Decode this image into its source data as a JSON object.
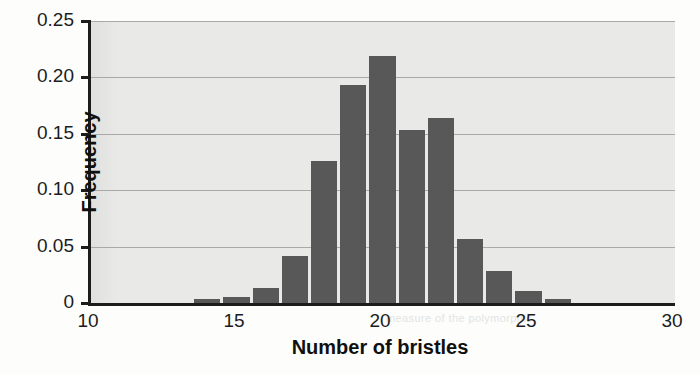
{
  "chart_data": {
    "type": "bar",
    "title": "",
    "subtitle": "",
    "xlabel": "Number of bristles",
    "ylabel": "Frequency",
    "categories": [
      14,
      15,
      16,
      17,
      18,
      19,
      20,
      21,
      22,
      23,
      24,
      25,
      26
    ],
    "values": [
      0.004,
      0.005,
      0.013,
      0.042,
      0.126,
      0.193,
      0.219,
      0.153,
      0.164,
      0.057,
      0.028,
      0.011,
      0.004
    ],
    "series": [
      {
        "name": "Frequency",
        "values": [
          0.004,
          0.005,
          0.013,
          0.042,
          0.126,
          0.193,
          0.219,
          0.153,
          0.164,
          0.057,
          0.028,
          0.011,
          0.004
        ]
      }
    ],
    "xlim": [
      10,
      30
    ],
    "ylim": [
      0,
      0.25
    ],
    "xticks": [
      10,
      15,
      20,
      25,
      30
    ],
    "xtick_labels": [
      "10",
      "15",
      "20",
      "25",
      "30"
    ],
    "yticks": [
      0,
      0.05,
      0.1,
      0.15,
      0.2,
      0.25
    ],
    "ytick_labels": [
      "0",
      "0.05",
      "0.10",
      "0.15",
      "0.20",
      "0.25"
    ],
    "grid": "horizontal",
    "legend": "none",
    "bar_color": "#585858",
    "panel_color": "#e9e9e7",
    "axis_color": "#1c1c1c",
    "bar_width": 1
  },
  "background_text": {
    "line1": "Great comprehension",
    "line2": "for 2015",
    "line3": "understanding the material",
    "line4": "measure of the polymorphic"
  }
}
